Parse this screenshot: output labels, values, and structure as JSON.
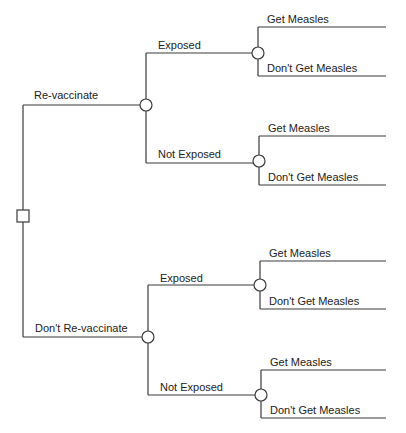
{
  "diagram": {
    "type": "decision-tree",
    "line_color": "#3a3a3a",
    "root": {
      "node_type": "decision",
      "shape": "square-icon",
      "branches": [
        {
          "label": "Re-vaccinate",
          "node_type": "chance",
          "branches": [
            {
              "label": "Exposed",
              "node_type": "chance",
              "branches": [
                {
                  "label": "Get Measles"
                },
                {
                  "label": "Don't Get Measles"
                }
              ]
            },
            {
              "label": "Not Exposed",
              "node_type": "chance",
              "branches": [
                {
                  "label": "Get Measles"
                },
                {
                  "label": "Don't Get Measles"
                }
              ]
            }
          ]
        },
        {
          "label": "Don't Re-vaccinate",
          "node_type": "chance",
          "branches": [
            {
              "label": "Exposed",
              "node_type": "chance",
              "branches": [
                {
                  "label": "Get Measles"
                },
                {
                  "label": "Don't Get Measles"
                }
              ]
            },
            {
              "label": "Not Exposed",
              "node_type": "chance",
              "branches": [
                {
                  "label": "Get Measles"
                },
                {
                  "label": "Don't Get Measles"
                }
              ]
            }
          ]
        }
      ]
    }
  }
}
